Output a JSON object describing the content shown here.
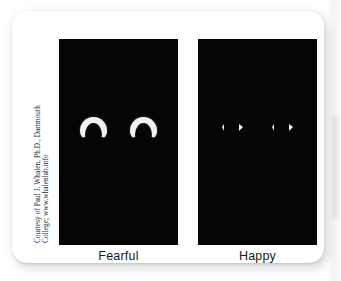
{
  "figure": {
    "credit_line_1": "Courtesy of Paul J. Whalen, Ph.D., Dartmouth",
    "credit_line_2": "College; www.whalenlab.info",
    "background_color": "#ffffff",
    "card_color": "#ffffff",
    "panel_color": "#050505",
    "sclera_color": "#f2f1ec",
    "label_color": "#1a1a1a"
  },
  "panels": [
    {
      "id": "fearful",
      "label": "Fearful",
      "eye_type": "wide-arch-crescent",
      "eye_count": 2,
      "description": "Large white crescent sclera arching above a dark pupil"
    },
    {
      "id": "happy",
      "label": "Happy",
      "eye_type": "narrow-triangular-slivers",
      "eye_count": 2,
      "description": "Two small triangular white slivers flanking a dark pupil"
    }
  ]
}
